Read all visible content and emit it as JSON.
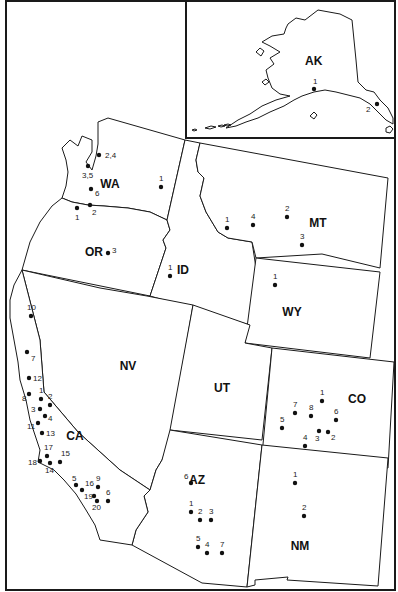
{
  "map": {
    "title": "",
    "inset": {
      "label": "AK",
      "sites": [
        {
          "n": "1",
          "x": 314,
          "y": 89,
          "lx": 313,
          "ly": 84
        },
        {
          "n": "2",
          "x": 377,
          "y": 104,
          "lx": 366,
          "ly": 112
        }
      ]
    },
    "states": [
      {
        "abbr": "WA",
        "lx": 110,
        "ly": 188
      },
      {
        "abbr": "OR",
        "lx": 94,
        "ly": 256
      },
      {
        "abbr": "ID",
        "lx": 183,
        "ly": 274
      },
      {
        "abbr": "MT",
        "lx": 318,
        "ly": 227
      },
      {
        "abbr": "WY",
        "lx": 292,
        "ly": 316
      },
      {
        "abbr": "NV",
        "lx": 128,
        "ly": 370
      },
      {
        "abbr": "UT",
        "lx": 222,
        "ly": 392
      },
      {
        "abbr": "CO",
        "lx": 357,
        "ly": 403
      },
      {
        "abbr": "CA",
        "lx": 75,
        "ly": 440
      },
      {
        "abbr": "AZ",
        "lx": 197,
        "ly": 484
      },
      {
        "abbr": "NM",
        "lx": 300,
        "ly": 550
      }
    ],
    "sites": [
      {
        "state": "WA",
        "n": "2,4",
        "x": 99,
        "y": 155,
        "lx": 105,
        "ly": 158
      },
      {
        "state": "WA",
        "n": "3,5",
        "x": 88,
        "y": 166,
        "lx": 82,
        "ly": 178
      },
      {
        "state": "WA",
        "n": "6",
        "x": 91,
        "y": 189,
        "lx": 95,
        "ly": 196
      },
      {
        "state": "WA",
        "n": "1",
        "x": 161,
        "y": 187,
        "lx": 159,
        "ly": 181
      },
      {
        "state": "WA",
        "n": "1",
        "x": 77,
        "y": 208,
        "lx": 75,
        "ly": 220
      },
      {
        "state": "WA",
        "n": "2",
        "x": 90,
        "y": 205,
        "lx": 92,
        "ly": 215
      },
      {
        "state": "OR",
        "n": "3",
        "x": 108,
        "y": 253,
        "lx": 112,
        "ly": 253
      },
      {
        "state": "ID",
        "n": "1",
        "x": 170,
        "y": 276,
        "lx": 168,
        "ly": 270
      },
      {
        "state": "MT",
        "n": "1",
        "x": 227,
        "y": 228,
        "lx": 225,
        "ly": 222
      },
      {
        "state": "MT",
        "n": "4",
        "x": 253,
        "y": 225,
        "lx": 251,
        "ly": 219
      },
      {
        "state": "MT",
        "n": "2",
        "x": 287,
        "y": 217,
        "lx": 285,
        "ly": 211
      },
      {
        "state": "MT",
        "n": "3",
        "x": 302,
        "y": 245,
        "lx": 300,
        "ly": 239
      },
      {
        "state": "WY",
        "n": "1",
        "x": 275,
        "y": 285,
        "lx": 273,
        "ly": 279
      },
      {
        "state": "CA",
        "n": "10",
        "x": 31,
        "y": 316,
        "lx": 27,
        "ly": 310
      },
      {
        "state": "CA",
        "n": "7",
        "x": 27,
        "y": 352,
        "lx": 31,
        "ly": 361
      },
      {
        "state": "CA",
        "n": "12",
        "x": 29,
        "y": 378,
        "lx": 33,
        "ly": 381
      },
      {
        "state": "CA",
        "n": "8",
        "x": 29,
        "y": 394,
        "lx": 22,
        "ly": 401
      },
      {
        "state": "CA",
        "n": "1",
        "x": 41,
        "y": 399,
        "lx": 39,
        "ly": 393
      },
      {
        "state": "CA",
        "n": "2",
        "x": 50,
        "y": 405,
        "lx": 48,
        "ly": 399
      },
      {
        "state": "CA",
        "n": "3",
        "x": 40,
        "y": 409,
        "lx": 31,
        "ly": 412
      },
      {
        "state": "CA",
        "n": "4",
        "x": 45,
        "y": 416,
        "lx": 48,
        "ly": 421
      },
      {
        "state": "CA",
        "n": "11",
        "x": 38,
        "y": 423,
        "lx": 27,
        "ly": 429
      },
      {
        "state": "CA",
        "n": "13",
        "x": 42,
        "y": 433,
        "lx": 46,
        "ly": 436
      },
      {
        "state": "CA",
        "n": "17",
        "x": 47,
        "y": 456,
        "lx": 44,
        "ly": 450
      },
      {
        "state": "CA",
        "n": "15",
        "x": 60,
        "y": 462,
        "lx": 61,
        "ly": 456
      },
      {
        "state": "CA",
        "n": "18",
        "x": 40,
        "y": 461,
        "lx": 28,
        "ly": 465
      },
      {
        "state": "CA",
        "n": "14",
        "x": 50,
        "y": 463,
        "lx": 45,
        "ly": 473
      },
      {
        "state": "CA",
        "n": "5",
        "x": 76,
        "y": 485,
        "lx": 72,
        "ly": 481
      },
      {
        "state": "CA",
        "n": "16",
        "x": 82,
        "y": 490,
        "lx": 85,
        "ly": 486
      },
      {
        "state": "CA",
        "n": "9",
        "x": 98,
        "y": 487,
        "lx": 96,
        "ly": 481
      },
      {
        "state": "CA",
        "n": "19",
        "x": 94,
        "y": 496,
        "lx": 84,
        "ly": 499
      },
      {
        "state": "CA",
        "n": "20",
        "x": 97,
        "y": 501,
        "lx": 92,
        "ly": 510
      },
      {
        "state": "CA",
        "n": "6",
        "x": 108,
        "y": 501,
        "lx": 106,
        "ly": 495
      },
      {
        "state": "AZ",
        "n": "6",
        "x": 191,
        "y": 483,
        "lx": 184,
        "ly": 479
      },
      {
        "state": "AZ",
        "n": "1",
        "x": 191,
        "y": 512,
        "lx": 189,
        "ly": 506
      },
      {
        "state": "AZ",
        "n": "2",
        "x": 200,
        "y": 520,
        "lx": 198,
        "ly": 514
      },
      {
        "state": "AZ",
        "n": "3",
        "x": 211,
        "y": 520,
        "lx": 209,
        "ly": 514
      },
      {
        "state": "AZ",
        "n": "5",
        "x": 198,
        "y": 547,
        "lx": 196,
        "ly": 541
      },
      {
        "state": "AZ",
        "n": "4",
        "x": 207,
        "y": 553,
        "lx": 205,
        "ly": 547
      },
      {
        "state": "AZ",
        "n": "7",
        "x": 222,
        "y": 553,
        "lx": 220,
        "ly": 547
      },
      {
        "state": "CO",
        "n": "1",
        "x": 322,
        "y": 401,
        "lx": 320,
        "ly": 395
      },
      {
        "state": "CO",
        "n": "7",
        "x": 295,
        "y": 413,
        "lx": 293,
        "ly": 407
      },
      {
        "state": "CO",
        "n": "8",
        "x": 311,
        "y": 416,
        "lx": 309,
        "ly": 410
      },
      {
        "state": "CO",
        "n": "6",
        "x": 336,
        "y": 420,
        "lx": 334,
        "ly": 414
      },
      {
        "state": "CO",
        "n": "5",
        "x": 282,
        "y": 428,
        "lx": 280,
        "ly": 422
      },
      {
        "state": "CO",
        "n": "3",
        "x": 319,
        "y": 431,
        "lx": 315,
        "ly": 441
      },
      {
        "state": "CO",
        "n": "2",
        "x": 328,
        "y": 432,
        "lx": 331,
        "ly": 440
      },
      {
        "state": "CO",
        "n": "4",
        "x": 305,
        "y": 446,
        "lx": 303,
        "ly": 440
      },
      {
        "state": "NM",
        "n": "1",
        "x": 295,
        "y": 483,
        "lx": 293,
        "ly": 477
      },
      {
        "state": "NM",
        "n": "2",
        "x": 304,
        "y": 516,
        "lx": 302,
        "ly": 510
      }
    ]
  }
}
